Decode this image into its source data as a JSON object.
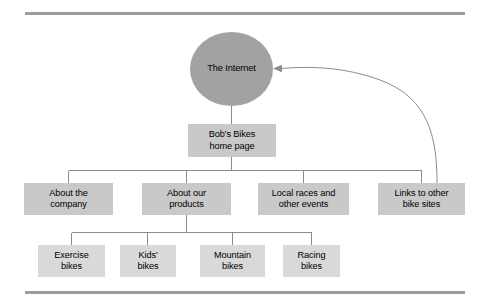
{
  "figure": {
    "name": "bobs-bikes-site-structure-diagram",
    "background_color": "#ffffff",
    "rules": {
      "color": "#9d9d9d",
      "top_label": "top-rule",
      "bottom_label": "bottom-rule"
    },
    "colors": {
      "circle_fill": "#a2a2a2",
      "box_fill": "#c9c9c9",
      "box_fill_light": "#d9d9d9",
      "line": "#8c8c8c",
      "text": "#000000"
    }
  },
  "nodes": {
    "internet": {
      "label": "The Internet",
      "shape": "circle"
    },
    "home_page": {
      "label": "Bob's Bikes\nhome page",
      "shape": "rectangle"
    },
    "level2": [
      {
        "label": "About the\ncompany",
        "shape": "rectangle"
      },
      {
        "label": "About our\nproducts",
        "shape": "rectangle"
      },
      {
        "label": "Local races and\nother events",
        "shape": "rectangle"
      },
      {
        "label": "Links to other\nbike sites",
        "shape": "rectangle"
      }
    ],
    "level3": [
      {
        "label": "Exercise\nbikes",
        "shape": "rectangle"
      },
      {
        "label": "Kids'\nbikes",
        "shape": "rectangle"
      },
      {
        "label": "Mountain\nbikes",
        "shape": "rectangle"
      },
      {
        "label": "Racing\nbikes",
        "shape": "rectangle"
      }
    ]
  },
  "connectors": {
    "internet_to_home": "vertical-line",
    "home_to_level2": "bus-tree",
    "products_to_level3": "bus-tree",
    "links_to_internet": "curved-arrow"
  }
}
